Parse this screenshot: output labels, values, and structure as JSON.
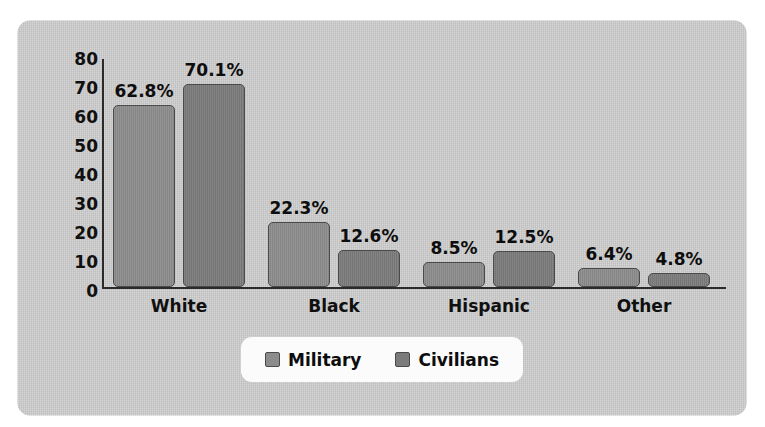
{
  "chart_data": {
    "type": "bar",
    "title": "",
    "xlabel": "",
    "ylabel": "Percentage",
    "ylim": [
      0,
      80
    ],
    "yticks": [
      0,
      10,
      20,
      30,
      40,
      50,
      60,
      70,
      80
    ],
    "ytick_labels": [
      "0",
      "10",
      "20",
      "30",
      "40",
      "50",
      "60",
      "70",
      "80"
    ],
    "grid": false,
    "legend_position": "bottom-center",
    "categories": [
      "White",
      "Black",
      "Hispanic",
      "Other"
    ],
    "series": [
      {
        "name": "Military",
        "color": "#8c8c8c",
        "values": [
          62.8,
          22.3,
          8.5,
          6.4
        ],
        "labels": [
          "62.8%",
          "22.3%",
          "8.5%",
          "6.4%"
        ]
      },
      {
        "name": "Civilians",
        "color": "#7b7b7b",
        "values": [
          70.1,
          12.6,
          12.5,
          4.8
        ],
        "labels": [
          "70.1%",
          "12.6%",
          "12.5%",
          "4.8%"
        ]
      }
    ]
  },
  "legend": {
    "entries": [
      {
        "label": "Military",
        "series": "military"
      },
      {
        "label": "Civilians",
        "series": "civilians"
      }
    ]
  },
  "colors": {
    "panel_background": "#cbcbcb",
    "military": "#8c8c8c",
    "civilians": "#7b7b7b",
    "axis": "#2a2a2a",
    "text": "#101010",
    "legend_background": "#fbfbfb"
  }
}
